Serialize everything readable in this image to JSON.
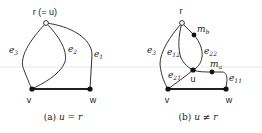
{
  "panels": [
    {
      "id": "a",
      "root_label": "r (= u)",
      "nodes": {
        "v": "v",
        "w": "w"
      },
      "edges": [
        {
          "name": "e",
          "sub": "3"
        },
        {
          "name": "e",
          "sub": "2"
        },
        {
          "name": "e",
          "sub": "1"
        }
      ],
      "caption": {
        "prefix": "(a) ",
        "math": "u = r"
      }
    },
    {
      "id": "b",
      "root_label": "r",
      "nodes": {
        "u": "u",
        "v": "v",
        "w": "w",
        "mb": {
          "name": "m",
          "sub": "b"
        },
        "ma": {
          "name": "m",
          "sub": "a"
        }
      },
      "edges": [
        {
          "name": "e",
          "sub": "3"
        },
        {
          "name": "e",
          "sub": "12"
        },
        {
          "name": "e",
          "sub": "22"
        },
        {
          "name": "e",
          "sub": "21"
        },
        {
          "name": "e",
          "sub": "11"
        }
      ],
      "caption": {
        "prefix": "(b) ",
        "math": "u ≠ r"
      }
    }
  ],
  "colors": {
    "line": "#333333",
    "node": "#111111",
    "background": "#ffffff"
  }
}
